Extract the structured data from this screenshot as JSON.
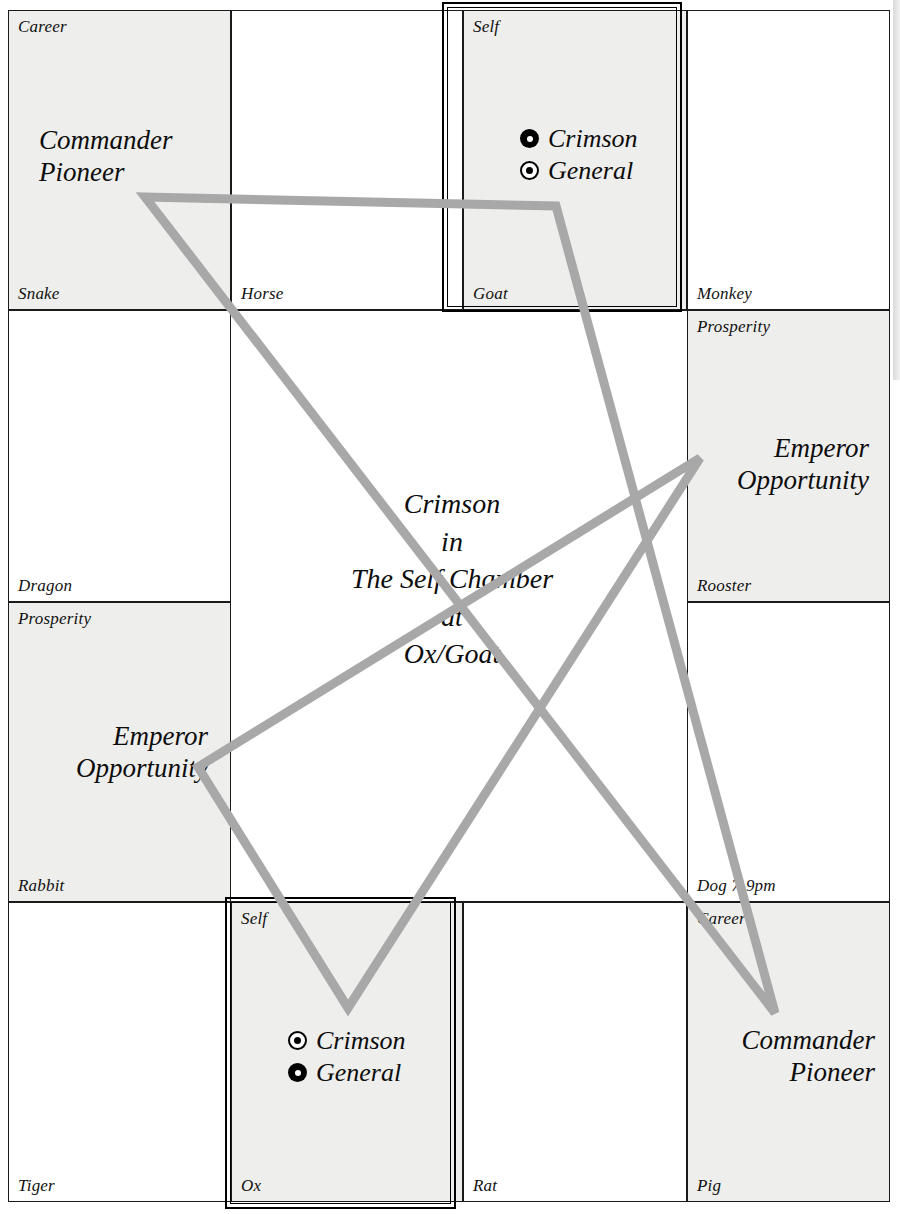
{
  "chart": {
    "type": "astrology-palace-grid",
    "title_center": "Crimson\nin\nThe Self Chamber\nat\nOx/Goat",
    "accent_line_color": "#a8a8a8",
    "shaded_cell_color": "#eeeeec",
    "grid_line_color": "#1a1a1a",
    "rows": 4,
    "cols": 4
  },
  "cells": {
    "snake": {
      "top_label": "Career",
      "bottom_label": "Snake",
      "stars": "Commander\nPioneer",
      "shaded": true
    },
    "horse": {
      "top_label": "",
      "bottom_label": "Horse",
      "stars": "",
      "shaded": false
    },
    "goat": {
      "top_label": "Self",
      "bottom_label": "Goat",
      "stars": "",
      "shaded": true,
      "markers": [
        {
          "label": "Crimson",
          "style": "filled-ring"
        },
        {
          "label": "General",
          "style": "outline-dot"
        }
      ]
    },
    "monkey": {
      "top_label": "",
      "bottom_label": "Monkey",
      "stars": "",
      "shaded": false
    },
    "dragon": {
      "top_label": "",
      "bottom_label": "Dragon",
      "stars": "",
      "shaded": false
    },
    "rooster": {
      "top_label": "Prosperity",
      "bottom_label": "Rooster",
      "stars": "Emperor\nOpportunity",
      "shaded": true
    },
    "rabbit": {
      "top_label": "Prosperity",
      "bottom_label": "Rabbit",
      "stars": "Emperor\nOpportunity",
      "shaded": true
    },
    "dog": {
      "top_label": "",
      "bottom_label": "Dog 7-9pm",
      "stars": "",
      "shaded": false
    },
    "tiger": {
      "top_label": "",
      "bottom_label": "Tiger",
      "stars": "",
      "shaded": false
    },
    "ox": {
      "top_label": "Self",
      "bottom_label": "Ox",
      "stars": "",
      "shaded": true,
      "markers": [
        {
          "label": "Crimson",
          "style": "outline-dot"
        },
        {
          "label": "General",
          "style": "filled-ring"
        }
      ]
    },
    "rat": {
      "top_label": "",
      "bottom_label": "Rat",
      "stars": "",
      "shaded": false
    },
    "pig": {
      "top_label": "Career",
      "bottom_label": "Pig",
      "stars": "Commander\nPioneer",
      "shaded": true
    }
  },
  "overlay": {
    "description": "two overlapping grey triangles connecting palaces",
    "color": "#a8a8a8",
    "stroke_width": 9,
    "triangles": [
      {
        "name": "triangle-snake-goat-pig",
        "points": "145,197 556,206 775,1013"
      },
      {
        "name": "triangle-rabbit-rooster-ox",
        "points": "198,767 700,458 348,1008"
      }
    ]
  }
}
